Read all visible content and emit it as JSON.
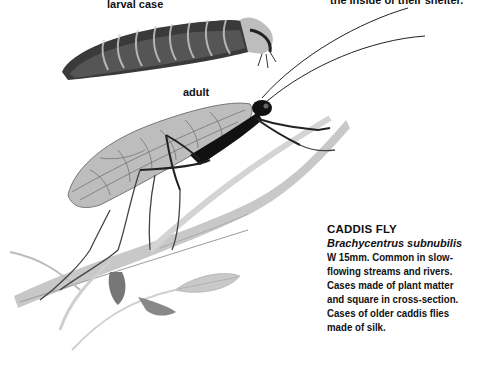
{
  "top_caption": "the inside of their shelter.",
  "labels": {
    "larval_case": "larval case",
    "adult": "adult"
  },
  "caption": {
    "title": "CADDIS FLY",
    "latin_name": "Brachycentrus subnubilis",
    "lines": [
      "W 15mm. Common in slow-",
      "flowing streams and rivers.",
      "Cases made of plant matter",
      "and square in cross-section.",
      "Cases of older caddis flies",
      "made of silk."
    ]
  },
  "illustration": {
    "subjects": [
      "caddis-fly-larval-case",
      "caddis-fly-adult",
      "plant-stem",
      "leaves"
    ]
  }
}
